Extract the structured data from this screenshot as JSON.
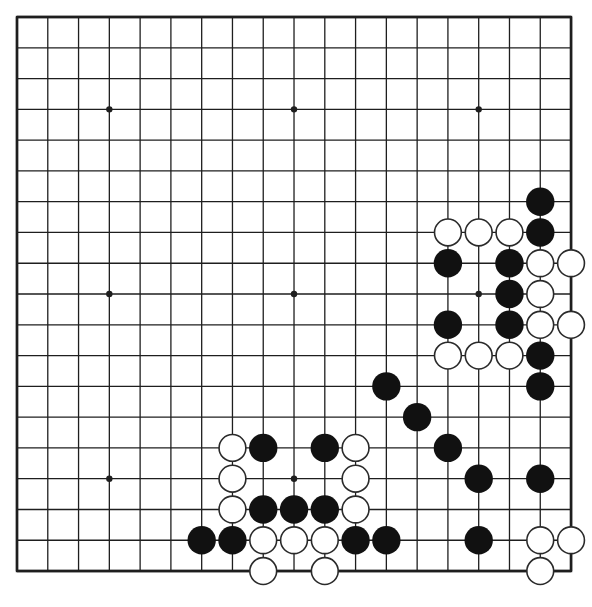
{
  "board": {
    "size": 19,
    "origin": [
      17,
      17
    ],
    "spacing": 30.78,
    "line_color": "#1e1e1e",
    "edge_width": 2.4,
    "line_width": 1.3,
    "stone_radius": 14.2,
    "black_color": "#111111",
    "white_color": "#ffffff",
    "white_outline": "#2a2a2a",
    "star_points": [
      [
        3,
        3
      ],
      [
        9,
        3
      ],
      [
        15,
        3
      ],
      [
        3,
        9
      ],
      [
        9,
        9
      ],
      [
        15,
        9
      ],
      [
        3,
        15
      ],
      [
        9,
        15
      ],
      [
        15,
        15
      ]
    ],
    "black_stones": [
      [
        17,
        6
      ],
      [
        17,
        7
      ],
      [
        14,
        8
      ],
      [
        16,
        8
      ],
      [
        16,
        9
      ],
      [
        14,
        10
      ],
      [
        16,
        10
      ],
      [
        17,
        11
      ],
      [
        12,
        12
      ],
      [
        17,
        12
      ],
      [
        13,
        13
      ],
      [
        8,
        14
      ],
      [
        10,
        14
      ],
      [
        14,
        14
      ],
      [
        15,
        15
      ],
      [
        17,
        15
      ],
      [
        8,
        16
      ],
      [
        9,
        16
      ],
      [
        10,
        16
      ],
      [
        6,
        17
      ],
      [
        7,
        17
      ],
      [
        11,
        17
      ],
      [
        12,
        17
      ],
      [
        15,
        17
      ]
    ],
    "white_stones": [
      [
        14,
        7
      ],
      [
        15,
        7
      ],
      [
        16,
        7
      ],
      [
        17,
        8
      ],
      [
        18,
        8
      ],
      [
        17,
        9
      ],
      [
        17,
        10
      ],
      [
        18,
        10
      ],
      [
        14,
        11
      ],
      [
        15,
        11
      ],
      [
        16,
        11
      ],
      [
        7,
        14
      ],
      [
        11,
        14
      ],
      [
        7,
        15
      ],
      [
        11,
        15
      ],
      [
        7,
        16
      ],
      [
        11,
        16
      ],
      [
        8,
        17
      ],
      [
        9,
        17
      ],
      [
        10,
        17
      ],
      [
        17,
        17
      ],
      [
        18,
        17
      ],
      [
        8,
        18
      ],
      [
        10,
        18
      ],
      [
        17,
        18
      ]
    ]
  }
}
